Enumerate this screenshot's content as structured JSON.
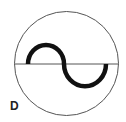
{
  "diagram": {
    "label": "D",
    "symbol": "ac-sine-wave-in-circle",
    "colors": {
      "outline": "#555555",
      "wave": "#111111",
      "background": "#ffffff"
    }
  }
}
